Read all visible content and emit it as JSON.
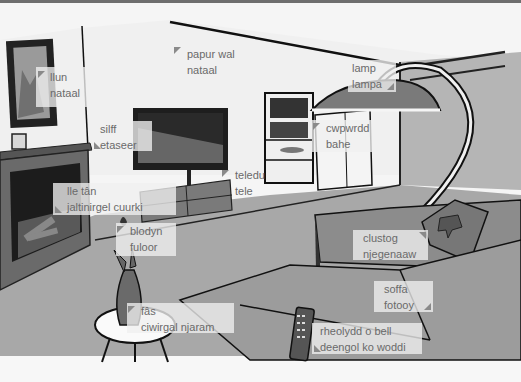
{
  "scene": {
    "description": "Living room illustration with bilingual vocabulary labels",
    "colors": {
      "wall": "#f2f2f2",
      "floor": "#a9a9a9",
      "sofa": "#9a9a9a",
      "dark": "#2b2b2b",
      "label_bg": "#efefef",
      "label_text": "#6a6a6a"
    }
  },
  "labels": [
    {
      "id": "picture",
      "line1": "llun",
      "line2": "nataal",
      "marker": "top-left"
    },
    {
      "id": "wallpaper",
      "line1": "papur wal",
      "line2": "nataal",
      "marker": "top-left"
    },
    {
      "id": "lamp",
      "line1": "lamp",
      "line2": "lampa",
      "marker": "bottom-right"
    },
    {
      "id": "shelf",
      "line1": "silff",
      "line2": "etaseer",
      "marker": "bottom-left"
    },
    {
      "id": "cupboard",
      "line1": "cwpwrdd",
      "line2": "bahe",
      "marker": "top-left"
    },
    {
      "id": "tv",
      "line1": "teledu",
      "line2": "tele",
      "marker": "top-left"
    },
    {
      "id": "fireplace",
      "line1": "lle tân",
      "line2": "jaltinirgel cuurki",
      "marker": "bottom-left"
    },
    {
      "id": "flower",
      "line1": "blodyn",
      "line2": "fuloor",
      "marker": "top-left"
    },
    {
      "id": "cushion",
      "line1": "clustog",
      "line2": "njegenaaw",
      "marker": "top-right"
    },
    {
      "id": "sofa",
      "line1": "soffa",
      "line2": "fotooy",
      "marker": "bottom-right"
    },
    {
      "id": "vase",
      "line1": "fâs",
      "line2": "ciwirgal njaram",
      "marker": "top-left"
    },
    {
      "id": "remote",
      "line1": "rheolydd o bell",
      "line2": "deengol ko woddi",
      "marker": "bottom-left"
    }
  ]
}
